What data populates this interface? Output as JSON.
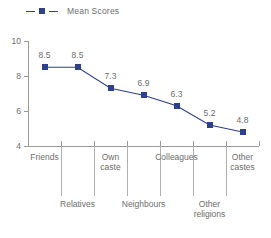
{
  "legend": {
    "marker_icon": "legend-square-marker",
    "label": "Mean Scores"
  },
  "colors": {
    "series": "#2e3f8f",
    "text": "#6d6d6d",
    "axis": "#9a9a9a",
    "divider": "#b0b0b0",
    "background": "#ffffff"
  },
  "axis": {
    "y_ticks": [
      "10",
      "8",
      "6",
      "4"
    ],
    "y_min": 4,
    "y_max": 10
  },
  "chart_data": {
    "type": "line",
    "title": "",
    "xlabel": "",
    "ylabel": "",
    "ylim": [
      4,
      10
    ],
    "yticks": [
      4,
      6,
      8,
      10
    ],
    "grid": false,
    "legend_position": "top-left",
    "series": [
      {
        "name": "Mean Scores",
        "color": "#2e3f8f",
        "marker": "square",
        "values": [
          8.5,
          8.5,
          7.3,
          6.9,
          6.3,
          5.2,
          4.8
        ]
      }
    ],
    "categories": [
      "Friends",
      "Relatives",
      "Own caste",
      "Neighbours",
      "Colleagues",
      "Other religions",
      "Other castes"
    ],
    "data_labels": [
      "8.5",
      "8.5",
      "7.3",
      "6.9",
      "6.3",
      "5.2",
      "4.8"
    ]
  },
  "category_labels": {
    "upper_row": [
      {
        "text": "Friends",
        "index": 0
      },
      {
        "text": "Own\ncaste",
        "index": 2
      },
      {
        "text": "Colleagues",
        "index": 4
      },
      {
        "text": "Other\ncastes",
        "index": 6
      }
    ],
    "lower_row": [
      {
        "text": "Relatives",
        "index": 1
      },
      {
        "text": "Neighbours",
        "index": 3
      },
      {
        "text": "Other\nreligions",
        "index": 5
      }
    ]
  }
}
